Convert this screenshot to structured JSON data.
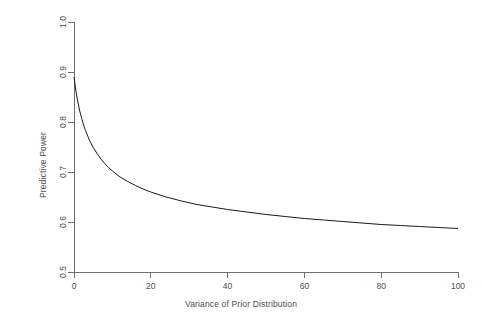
{
  "chart_data": {
    "type": "line",
    "title": "",
    "xlabel": "Variance of Prior Distribution",
    "ylabel": "Predictive Power",
    "xlim": [
      0,
      100
    ],
    "ylim": [
      0.5,
      1.0
    ],
    "xticks": [
      0,
      20,
      40,
      60,
      80,
      100
    ],
    "xtick_labels": [
      "0",
      "20",
      "40",
      "60",
      "80",
      "100"
    ],
    "yticks": [
      0.5,
      0.6,
      0.7,
      0.8,
      0.9,
      1.0
    ],
    "ytick_labels": [
      "0.5",
      "0.6",
      "0.7",
      "0.8",
      "0.9",
      "1.0"
    ],
    "grid": false,
    "legend": null,
    "line_color": "#1a1a1a",
    "axis_color": "#6e6e6e",
    "text_color": "#4d4d4d",
    "background": "#ffffff",
    "series": [
      {
        "name": "Predictive Power",
        "x": [
          0,
          0.5,
          1,
          1.5,
          2,
          2.5,
          3,
          4,
          5,
          6,
          7,
          8,
          9,
          10,
          12,
          14,
          16,
          18,
          20,
          24,
          28,
          32,
          36,
          40,
          45,
          50,
          55,
          60,
          65,
          70,
          75,
          80,
          85,
          90,
          95,
          100
        ],
        "y": [
          0.89,
          0.862,
          0.84,
          0.822,
          0.807,
          0.794,
          0.783,
          0.764,
          0.749,
          0.737,
          0.726,
          0.717,
          0.709,
          0.702,
          0.69,
          0.681,
          0.673,
          0.666,
          0.66,
          0.65,
          0.642,
          0.635,
          0.63,
          0.625,
          0.62,
          0.615,
          0.611,
          0.607,
          0.604,
          0.601,
          0.598,
          0.595,
          0.593,
          0.591,
          0.589,
          0.587
        ]
      }
    ]
  },
  "axes": {
    "xlabel": "Variance of Prior Distribution",
    "ylabel": "Predictive Power"
  }
}
